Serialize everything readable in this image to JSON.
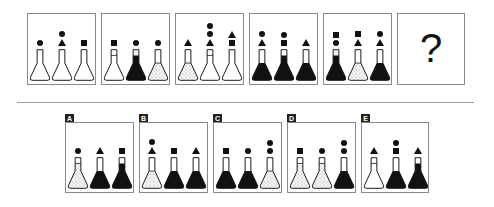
{
  "question_mark": "?",
  "sequence": [
    {
      "flasks": [
        {
          "symbols": [
            "circle"
          ],
          "fill": "empty"
        },
        {
          "symbols": [
            "circle",
            "triangle"
          ],
          "fill": "empty"
        },
        {
          "symbols": [
            "square"
          ],
          "fill": "empty"
        }
      ]
    },
    {
      "flasks": [
        {
          "symbols": [
            "square"
          ],
          "fill": "empty-high"
        },
        {
          "symbols": [
            "circle"
          ],
          "fill": "black-high"
        },
        {
          "symbols": [
            "circle"
          ],
          "fill": "dots-base"
        }
      ]
    },
    {
      "flasks": [
        {
          "symbols": [
            "triangle"
          ],
          "fill": "dots-base"
        },
        {
          "symbols": [
            "circle",
            "circle",
            "triangle"
          ],
          "fill": "empty-high"
        },
        {
          "symbols": [
            "triangle",
            "square"
          ],
          "fill": "empty"
        }
      ]
    },
    {
      "flasks": [
        {
          "symbols": [
            "circle",
            "triangle"
          ],
          "fill": "black-base"
        },
        {
          "symbols": [
            "circle",
            "square"
          ],
          "fill": "black-high"
        },
        {
          "symbols": [
            "triangle"
          ],
          "fill": "black-base"
        }
      ]
    },
    {
      "flasks": [
        {
          "symbols": [
            "square",
            "circle"
          ],
          "fill": "black-high"
        },
        {
          "symbols": [
            "square",
            "triangle"
          ],
          "fill": "dots-base"
        },
        {
          "symbols": [
            "circle",
            "triangle"
          ],
          "fill": "black-base"
        }
      ]
    }
  ],
  "options": [
    {
      "label": "A",
      "flasks": [
        {
          "symbols": [
            "circle"
          ],
          "fill": "dots-high"
        },
        {
          "symbols": [
            "triangle"
          ],
          "fill": "black-base"
        },
        {
          "symbols": [
            "square"
          ],
          "fill": "black-high"
        }
      ]
    },
    {
      "label": "B",
      "flasks": [
        {
          "symbols": [
            "circle",
            "triangle"
          ],
          "fill": "dots-base"
        },
        {
          "symbols": [
            "square"
          ],
          "fill": "black-base"
        },
        {
          "symbols": [
            "triangle"
          ],
          "fill": "black-base"
        }
      ]
    },
    {
      "label": "C",
      "flasks": [
        {
          "symbols": [
            "square"
          ],
          "fill": "black-base"
        },
        {
          "symbols": [
            "circle"
          ],
          "fill": "black-base"
        },
        {
          "symbols": [
            "circle",
            "circle"
          ],
          "fill": "dots-base"
        }
      ]
    },
    {
      "label": "D",
      "flasks": [
        {
          "symbols": [
            "square"
          ],
          "fill": "dots-high"
        },
        {
          "symbols": [
            "circle"
          ],
          "fill": "dots-high"
        },
        {
          "symbols": [
            "circle",
            "circle"
          ],
          "fill": "black-base"
        }
      ]
    },
    {
      "label": "E",
      "flasks": [
        {
          "symbols": [
            "triangle"
          ],
          "fill": "empty-high"
        },
        {
          "symbols": [
            "circle",
            "square"
          ],
          "fill": "black-base"
        },
        {
          "symbols": [
            "triangle"
          ],
          "fill": "black-high"
        }
      ]
    }
  ],
  "colors": {
    "ink": "#111111",
    "border": "#8a8a8a",
    "divider": "#9a9a9a"
  }
}
